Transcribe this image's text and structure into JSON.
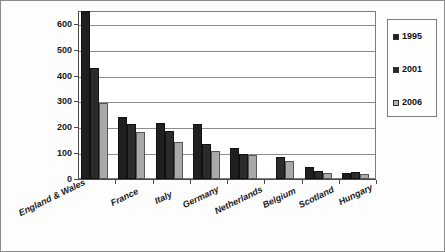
{
  "chart_data": {
    "type": "bar",
    "title": "",
    "subtitle": "",
    "xlabel": "",
    "ylabel": "",
    "ylim": [
      0,
      650
    ],
    "y_ticks": [
      0,
      100,
      200,
      300,
      400,
      500,
      600
    ],
    "y_tick_labels": [
      "0",
      "100",
      "200",
      "300",
      "400",
      "500",
      "600"
    ],
    "grid": "horizontal",
    "legend_position": "right",
    "categories": [
      "England & Wales",
      "France",
      "Italy",
      "Germany",
      "Netherlands",
      "Belgium",
      "Scotland",
      "Hungary"
    ],
    "series": [
      {
        "name": "1995",
        "color": "#1f1f1f",
        "values": [
          650,
          240,
          215,
          212,
          120,
          null,
          45,
          25
        ]
      },
      {
        "name": "2001",
        "color": "#2b2b2b",
        "values": [
          430,
          211,
          187,
          136,
          95,
          85,
          30,
          27
        ]
      },
      {
        "name": "2006",
        "color": "#a9a9a9",
        "values": [
          296,
          180,
          145,
          108,
          93,
          68,
          22,
          20
        ]
      }
    ]
  },
  "legend": {
    "entries": [
      {
        "label": "1995",
        "swatch": "legend-swatch-1995"
      },
      {
        "label": "2001",
        "swatch": "legend-swatch-2001"
      },
      {
        "label": "2006",
        "swatch": "legend-swatch-2006"
      }
    ]
  },
  "colors": {
    "series_1995": "#1f1f1f",
    "series_2001": "#2b2b2b",
    "series_2006": "#a9a9a9",
    "axis": "#4a4a4a",
    "gridline": "#8c8c8c",
    "frame": "#7d7d7d",
    "background": "#fdfdfd"
  }
}
